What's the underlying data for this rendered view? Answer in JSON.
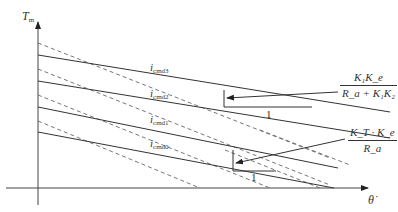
{
  "figure": {
    "y_axis_label": "T",
    "y_axis_sub": "m",
    "x_axis_label": "θ̇",
    "curves": [
      {
        "label": "i",
        "sub": "cmd3",
        "style": "solid"
      },
      {
        "label": "i",
        "sub": "cmd2",
        "style": "solid"
      },
      {
        "label": "i",
        "sub": "cmd1",
        "style": "solid"
      },
      {
        "label": "i",
        "sub": "cmd0",
        "style": "solid"
      }
    ],
    "slope_annotations": [
      {
        "numerator": "K₁K_e",
        "denominator": "R_a + K₁K₂",
        "run_label": "1"
      },
      {
        "numerator": "K_T · K_e",
        "denominator": "R_a",
        "run_label": "1"
      }
    ]
  },
  "colors": {
    "line": "#333333",
    "background": "#ffffff"
  }
}
